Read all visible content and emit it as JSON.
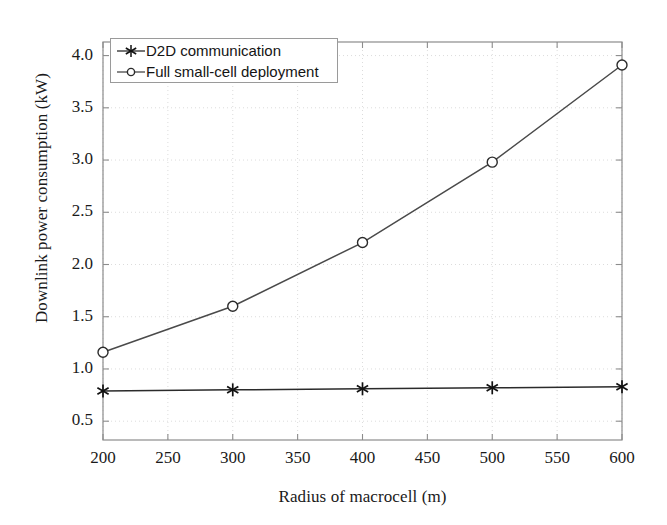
{
  "chart_data": {
    "type": "line",
    "title": "",
    "xlabel": "Radius of macrocell (m)",
    "ylabel": "Downlink power consumption (kW)",
    "x": [
      200,
      300,
      400,
      500,
      600
    ],
    "xlim": [
      200,
      600
    ],
    "ylim": [
      0.32,
      4.13
    ],
    "xticks": [
      200,
      250,
      300,
      350,
      400,
      450,
      500,
      550,
      600
    ],
    "xtick_labels": [
      "200",
      "250",
      "300",
      "350",
      "400",
      "450",
      "500",
      "550",
      "600"
    ],
    "yticks": [
      0.5,
      1.0,
      1.5,
      2.0,
      2.5,
      3.0,
      3.5,
      4.0
    ],
    "ytick_labels": [
      "0.5",
      "1.0",
      "1.5",
      "2.0",
      "2.5",
      "3.0",
      "3.5",
      "4.0"
    ],
    "grid": true,
    "grid_style": "dotted",
    "grid_color": "#dcdcdc",
    "legend_position": "upper left",
    "series": [
      {
        "name": "D2D communication",
        "marker": "asterisk",
        "color": "#2b2b2b",
        "values": [
          0.79,
          0.8,
          0.81,
          0.82,
          0.83
        ]
      },
      {
        "name": "Full small-cell deployment",
        "marker": "circle",
        "color": "#4a4a4a",
        "values": [
          1.16,
          1.6,
          2.21,
          2.98,
          3.91
        ]
      }
    ]
  },
  "colors": {
    "axis": "#8c8c8c",
    "text": "#1a1a1a",
    "grid": "#dcdcdc",
    "legend_border": "#9a9a9a",
    "background": "#ffffff"
  }
}
